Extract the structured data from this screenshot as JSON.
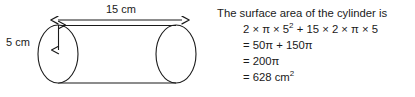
{
  "figure": {
    "shape": "cylinder",
    "length_label": "15 cm",
    "diameter_label": "5 cm",
    "stroke_color": "#1a1a1a"
  },
  "solution": {
    "intro": "The surface area of the cylinder is",
    "steps": [
      {
        "main": "2 × π × 5",
        "sup": "2",
        "tail": " + 15 × 2 × π × 5"
      },
      {
        "main": "= 50π  + 150π",
        "sup": "",
        "tail": ""
      },
      {
        "main": "= 200π",
        "sup": "",
        "tail": ""
      },
      {
        "main": "= 628 cm",
        "sup": "2",
        "tail": ""
      }
    ]
  },
  "math_data": {
    "radius": 5,
    "diameter": 5,
    "height": 15,
    "units": "cm",
    "curved_surface_area": "150π",
    "two_circle_area": "50π",
    "total_exact": "200π",
    "total_approx": 628,
    "area_units": "cm²"
  }
}
